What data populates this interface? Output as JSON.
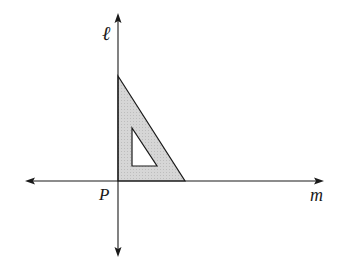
{
  "diagram": {
    "labels": {
      "vertical_line": "ℓ",
      "horizontal_line": "m",
      "intersection_point": "P"
    },
    "colors": {
      "line": "#1a1a1a",
      "triangle_fill": "#d4d4d4",
      "background": "#ffffff"
    },
    "shapes": {
      "outer_triangle": [
        [
          118,
          76
        ],
        [
          118,
          181
        ],
        [
          185,
          181
        ]
      ],
      "inner_triangle_hole": [
        [
          132,
          128
        ],
        [
          132,
          166
        ],
        [
          157,
          166
        ]
      ]
    }
  }
}
